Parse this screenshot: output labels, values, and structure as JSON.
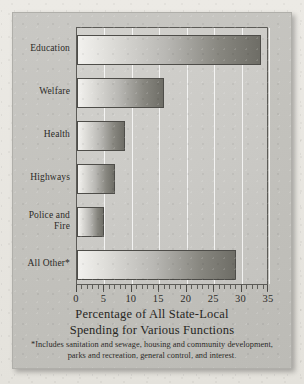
{
  "chart_data": {
    "type": "bar",
    "orientation": "horizontal",
    "title": "",
    "categories": [
      "Education",
      "Welfare",
      "Health",
      "Highways",
      "Police and\nFire",
      "All Other*"
    ],
    "values": [
      33.5,
      15.8,
      8.8,
      7.0,
      5.0,
      29.0
    ],
    "xlabel": "Percentage of All State-Local Spending for Various Functions",
    "ylabel": "",
    "xlim": [
      0,
      35
    ],
    "xticks": [
      0,
      5,
      10,
      15,
      20,
      25,
      30,
      35
    ],
    "xtick_labels": [
      "0",
      "5",
      "10",
      "15",
      "20",
      "25",
      "30",
      "35"
    ],
    "minor_tick_interval": 1,
    "grid": "vertical-major",
    "legend": "none",
    "bar_fill": "left-to-right light-to-dark gradient",
    "footnote": "*Includes sanitation and sewage, housing and community development, parks and recreation, general control, and interest."
  },
  "caption": {
    "line1": "Percentage of All State-Local",
    "line2": "Spending for Various Functions"
  },
  "footnote": "*Includes sanitation and sewage, housing and community development, parks and recreation, general control, and interest.",
  "colors": {
    "paper": "#e9e7e2",
    "panel": "#c6c5c0",
    "plot_background": "#cbcac6",
    "bar_light": "#f2f1ee",
    "bar_dark": "#6e6d66",
    "axis": "#4a4945",
    "gridline": "#ffffff",
    "text": "#2b2a27"
  }
}
